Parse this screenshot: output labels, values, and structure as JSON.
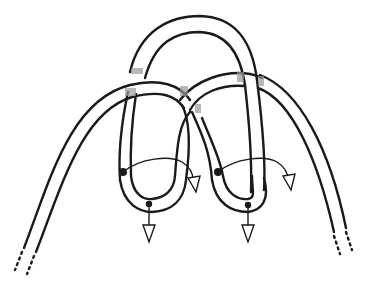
{
  "diagram": {
    "title": "",
    "colors": {
      "stroke": "#1a1a1a",
      "rope_fill": "#ffffff",
      "shading": "#9a9a9a",
      "background": "#ffffff"
    },
    "elements": {
      "left_standing_end": {
        "label": "",
        "style": "dotted-end"
      },
      "right_standing_end": {
        "label": "",
        "style": "dotted-end"
      },
      "top_arch": {
        "label": ""
      },
      "left_loop": {
        "label": "",
        "rotation_arrow": "clockwise-curve-right",
        "pull_arrow": "down"
      },
      "right_loop": {
        "label": "",
        "rotation_arrow": "clockwise-curve-right",
        "pull_arrow": "down"
      }
    }
  }
}
